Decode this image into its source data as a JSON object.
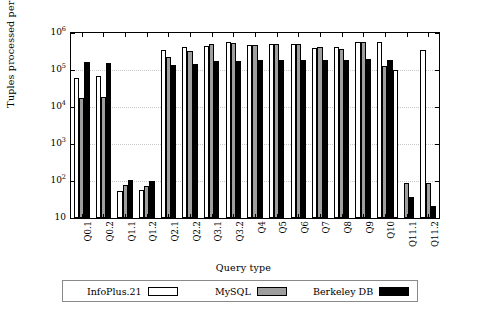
{
  "chart_data": {
    "type": "bar",
    "title": "",
    "xlabel": "Query type",
    "ylabel": "Tuples processed per second",
    "yscale": "log",
    "ylim": [
      10,
      1000000
    ],
    "ytick_labels": [
      "10",
      "10²",
      "10³",
      "10⁴",
      "10⁵",
      "10⁶"
    ],
    "ytick_values": [
      10,
      100,
      1000,
      10000,
      100000,
      1000000
    ],
    "grid": true,
    "legend_position": "below-plot",
    "categories": [
      "Q0.1",
      "Q0.2",
      "Q1.1",
      "Q1.2",
      "Q2.1",
      "Q2.2",
      "Q3.1",
      "Q3.2",
      "Q4",
      "Q5",
      "Q6",
      "Q7",
      "Q8",
      "Q9",
      "Q10",
      "Q11.1",
      "Q11.2"
    ],
    "series": [
      {
        "name": "InfoPlus.21",
        "color": "#ffffff",
        "values": [
          60000,
          68000,
          55,
          58,
          350000,
          430000,
          450000,
          560000,
          480000,
          500000,
          500000,
          400000,
          410000,
          580000,
          580000,
          null,
          350000
        ]
      },
      {
        "name": "MySQL",
        "color": "#9e9e9e",
        "values": [
          18000,
          19000,
          78,
          74,
          230000,
          330000,
          510000,
          540000,
          470000,
          510000,
          490000,
          410000,
          360000,
          570000,
          130000,
          90,
          90
        ]
      },
      {
        "name": "Berkeley DB",
        "color": "#000000",
        "values": [
          165000,
          155000,
          105,
          103,
          135000,
          145000,
          180000,
          180000,
          185000,
          190000,
          185000,
          190000,
          190000,
          200000,
          190000,
          37,
          21
        ]
      }
    ],
    "extra_bars": {
      "Q10_infoplus_second": 100000
    }
  },
  "legend": {
    "entries": [
      {
        "label": "InfoPlus.21",
        "swatch": "white-bar-swatch"
      },
      {
        "label": "MySQL",
        "swatch": "gray-bar-swatch"
      },
      {
        "label": "Berkeley DB",
        "swatch": "black-bar-swatch"
      }
    ]
  }
}
